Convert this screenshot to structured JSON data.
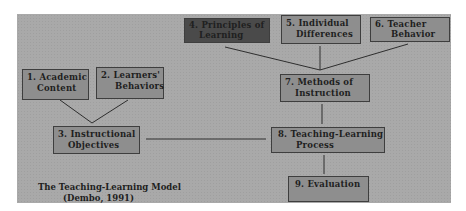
{
  "diagram": {
    "title": "The Teaching-Learning Model",
    "citation": "(Dembo, 1991)",
    "nodes": [
      {
        "id": "1",
        "line1": "1.  Academic",
        "line2": "Content"
      },
      {
        "id": "2",
        "line1": "2.  Learners'",
        "line2": "Behaviors"
      },
      {
        "id": "3",
        "line1": "3.  Instructional",
        "line2": "Objectives"
      },
      {
        "id": "4",
        "line1": "4.  Principles of",
        "line2": "Learning"
      },
      {
        "id": "5",
        "line1": "5.  Individual",
        "line2": "Differences"
      },
      {
        "id": "6",
        "line1": "6.  Teacher",
        "line2": "Behavior"
      },
      {
        "id": "7",
        "line1": "7.  Methods of",
        "line2": "Instruction"
      },
      {
        "id": "8",
        "line1": "8.  Teaching-Learning",
        "line2": "Process"
      },
      {
        "id": "9",
        "line1": "9.  Evaluation",
        "line2": ""
      }
    ],
    "edges": [
      [
        "1",
        "3"
      ],
      [
        "2",
        "3"
      ],
      [
        "3",
        "8"
      ],
      [
        "4",
        "7"
      ],
      [
        "5",
        "7"
      ],
      [
        "6",
        "7"
      ],
      [
        "7",
        "8"
      ],
      [
        "8",
        "9"
      ]
    ],
    "colors": {
      "panel": "#a9a9a9",
      "box": "#8e8e8e",
      "box_highlight": "#4a4a4a",
      "line": "#2e2e2e"
    }
  }
}
